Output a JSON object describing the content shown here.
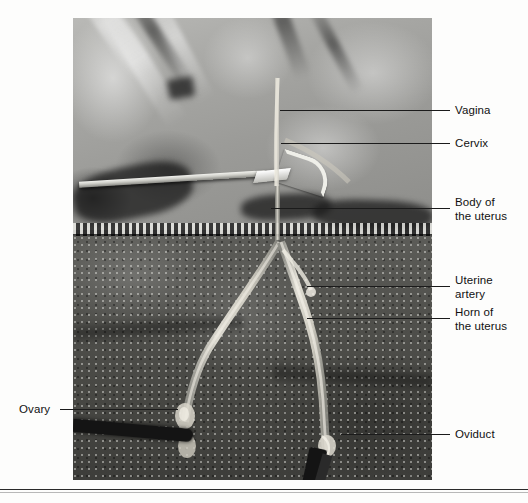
{
  "figure": {
    "type": "anatomical-photograph",
    "background_color": "#fdfdfc",
    "leader_line_color": "#1b1b1b",
    "label_text_color": "#111111"
  },
  "photo": {
    "left": 73,
    "top": 18,
    "width": 359,
    "height": 462,
    "description": "black-and-white surgical photograph of an exposed reproductive tract over a textured drape"
  },
  "labels": {
    "vagina": {
      "text": "Vagina",
      "x": 455,
      "y": 104,
      "leader": {
        "x1": 280,
        "x2": 450,
        "y": 110
      }
    },
    "cervix": {
      "text": "Cervix",
      "x": 455,
      "y": 137,
      "leader": {
        "x1": 281,
        "x2": 450,
        "y": 143
      }
    },
    "body_of_uterus": {
      "text": "Body of\nthe uterus",
      "x": 455,
      "y": 196,
      "leader": {
        "x1": 271,
        "x2": 450,
        "y": 208
      }
    },
    "uterine_artery": {
      "text": "Uterine\nartery",
      "x": 455,
      "y": 274,
      "leader": {
        "x1": 307,
        "x2": 450,
        "y": 286
      }
    },
    "horn_of_uterus": {
      "text": "Horn of\nthe uterus",
      "x": 455,
      "y": 306,
      "leader": {
        "x1": 307,
        "x2": 450,
        "y": 318
      }
    },
    "oviduct": {
      "text": "Oviduct",
      "x": 455,
      "y": 428,
      "leader": {
        "x1": 341,
        "x2": 450,
        "y": 434
      }
    },
    "ovary": {
      "text": "Ovary",
      "x": 19,
      "y": 403,
      "leader": {
        "x1": 60,
        "x2": 178,
        "y": 409
      }
    }
  }
}
